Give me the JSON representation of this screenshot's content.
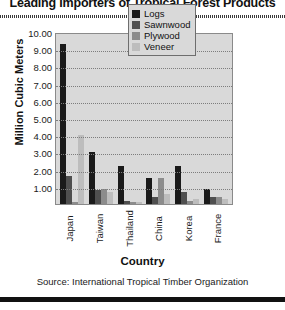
{
  "chart_data": {
    "type": "bar",
    "title": "Leading Importers of Tropical Forest Products",
    "xlabel": "Country",
    "ylabel": "Million Cubic Meters",
    "categories": [
      "Japan",
      "Taiwan",
      "Thailand",
      "China",
      "Korea",
      "France"
    ],
    "series": [
      {
        "name": "Logs",
        "color": "#1a1a1a",
        "values": [
          9.3,
          3.0,
          2.2,
          1.5,
          2.2,
          0.9
        ]
      },
      {
        "name": "Sawnwood",
        "color": "#4f4f4f",
        "values": [
          1.6,
          0.8,
          0.2,
          0.4,
          0.7,
          0.4
        ]
      },
      {
        "name": "Plywood",
        "color": "#8c8c8c",
        "values": [
          0.1,
          0.9,
          0.1,
          1.5,
          0.2,
          0.4
        ]
      },
      {
        "name": "Veneer",
        "color": "#bdbdbd",
        "values": [
          4.0,
          0.7,
          0.1,
          0.6,
          0.3,
          0.3
        ]
      }
    ],
    "ylim": [
      0,
      10
    ],
    "ytick_labels": [
      "10.00",
      "9.00",
      "8.00",
      "7.00",
      "6.00",
      "5.00",
      "4.00",
      "3.00",
      "2.00",
      "1.00"
    ],
    "ytick_values": [
      10,
      9,
      8,
      7,
      6,
      5,
      4,
      3,
      2,
      1
    ],
    "grid": true,
    "legend_position": "top-right",
    "source": "Source: International Tropical Timber Organization"
  }
}
